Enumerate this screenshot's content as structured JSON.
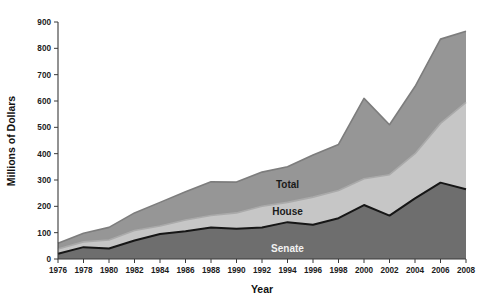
{
  "chart_data": {
    "type": "area",
    "stacked": true,
    "title": "",
    "xlabel": "Year",
    "ylabel": "Millions of Dollars",
    "categories": [
      1976,
      1978,
      1980,
      1982,
      1984,
      1986,
      1988,
      1990,
      1992,
      1994,
      1996,
      1998,
      2000,
      2002,
      2004,
      2006,
      2008
    ],
    "x_tick_labels": [
      "1976",
      "1978",
      "1980",
      "1982",
      "1984",
      "1986",
      "1988",
      "1990",
      "1992",
      "1994",
      "1996",
      "1998",
      "2000",
      "2002",
      "2004",
      "2006",
      "2008"
    ],
    "y_tick_labels": [
      "0",
      "100",
      "200",
      "300",
      "400",
      "500",
      "600",
      "700",
      "800",
      "900"
    ],
    "y_ticks": [
      0,
      100,
      200,
      300,
      400,
      500,
      600,
      700,
      800,
      900
    ],
    "ylim": [
      0,
      900
    ],
    "xlim": [
      1976,
      2008
    ],
    "grid": false,
    "legend_position": "inline-annotations",
    "series": [
      {
        "name": "Senate",
        "label": "Senate",
        "color": "#6e6e6e",
        "line_color": "#161616",
        "label_color": "#f2f2f2",
        "values": [
          20,
          45,
          40,
          70,
          95,
          105,
          120,
          115,
          120,
          140,
          130,
          155,
          205,
          165,
          230,
          290,
          265
        ]
      },
      {
        "name": "House",
        "label": "House",
        "color": "#c6c6c6",
        "line_color": "#aaaaaa",
        "label_color": "#1a1a1a",
        "values": [
          38,
          65,
          72,
          108,
          125,
          148,
          165,
          175,
          200,
          215,
          235,
          260,
          305,
          320,
          400,
          515,
          595
        ]
      },
      {
        "name": "Total",
        "label": "Total",
        "color": "#969696",
        "line_color": "#7d7d7d",
        "label_color": "#1a1a1a",
        "values": [
          60,
          98,
          120,
          175,
          215,
          255,
          293,
          292,
          330,
          350,
          395,
          435,
          610,
          510,
          655,
          835,
          865
        ]
      }
    ],
    "annotations": [
      {
        "text": "Total",
        "series": "Total"
      },
      {
        "text": "House",
        "series": "House"
      },
      {
        "text": "Senate",
        "series": "Senate"
      }
    ]
  },
  "colors": {
    "background": "#ffffff",
    "axis": "#3a3a3a",
    "text": "#111111",
    "senate_band": "#6e6e6e",
    "house_band": "#c6c6c6",
    "total_band": "#969696"
  }
}
